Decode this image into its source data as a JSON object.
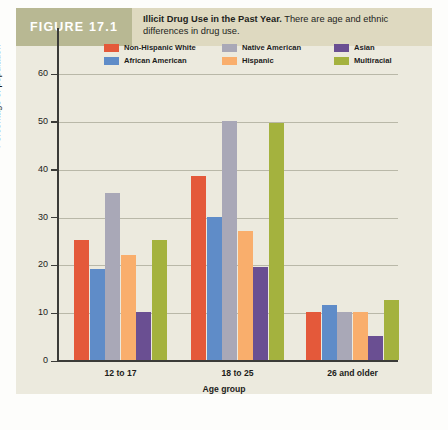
{
  "figure": {
    "tag": "FIGURE 17.1",
    "title": "Illicit Drug Use in the Past Year.",
    "subtitle": "There are age and ethnic differences in drug use."
  },
  "colors": {
    "non_hispanic_white": "#e4593a",
    "african_american": "#5f8cc8",
    "native_american": "#a9a8b7",
    "hispanic": "#f9ae6c",
    "asian": "#6a4f92",
    "multiracial": "#a4b23e",
    "panel_background": "#eceade",
    "caption_background": "#ded9c0",
    "tag_background": "#b8b893",
    "axis": "#3b3b38",
    "gridline": "#b9b8a8"
  },
  "chart_data": {
    "type": "bar",
    "title": "Illicit Drug Use in the Past Year",
    "xlabel": "Age group",
    "ylabel": "Percentage of population",
    "ylim": [
      0,
      60
    ],
    "yticks": [
      0,
      10,
      20,
      30,
      40,
      50,
      60
    ],
    "grid": true,
    "legend_position": "top-inside",
    "categories": [
      "12 to 17",
      "18 to 25",
      "26 and older"
    ],
    "series": [
      {
        "name": "Non-Hispanic White",
        "color": "#e4593a",
        "values": [
          25,
          38.5,
          10
        ]
      },
      {
        "name": "African American",
        "color": "#5f8cc8",
        "values": [
          19,
          30,
          11.5
        ]
      },
      {
        "name": "Native American",
        "color": "#a9a8b7",
        "values": [
          35,
          50,
          10
        ]
      },
      {
        "name": "Hispanic",
        "color": "#f9ae6c",
        "values": [
          22,
          27,
          10
        ]
      },
      {
        "name": "Asian",
        "color": "#6a4f92",
        "values": [
          10,
          19.5,
          5
        ]
      },
      {
        "name": "Multiracial",
        "color": "#a4b23e",
        "values": [
          25,
          49.5,
          12.5
        ]
      }
    ]
  }
}
